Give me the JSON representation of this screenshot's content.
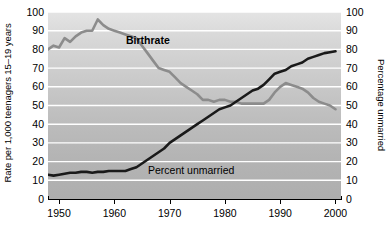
{
  "chart_data": {
    "type": "line",
    "title": "",
    "xlabel": "",
    "ylabel": "Rate per 1,000 teenagers 15–19 years",
    "ylabel_right": "Percentage unmarried",
    "xlim": [
      1948,
      2001
    ],
    "ylim": [
      0,
      100
    ],
    "grid": true,
    "gridlines_y": [
      10,
      20,
      30,
      40,
      50,
      60,
      70,
      80,
      90,
      100
    ],
    "legend_position": "inline-annotations",
    "xticks": [
      1950,
      1960,
      1970,
      1980,
      1990,
      2000
    ],
    "xtick_labels": [
      "1950",
      "1960",
      "1970",
      "1980",
      "1990",
      "2000"
    ],
    "yticks": [
      0,
      10,
      20,
      30,
      40,
      50,
      60,
      70,
      80,
      90,
      100
    ],
    "ytick_labels": [
      "0",
      "10",
      "20",
      "30",
      "40",
      "50",
      "60",
      "70",
      "80",
      "90",
      "100"
    ],
    "yticks_right": [
      0,
      10,
      20,
      30,
      40,
      50,
      60,
      70,
      80,
      90,
      100
    ],
    "ytick_labels_right": [
      "0",
      "10",
      "20",
      "30",
      "40",
      "50",
      "60",
      "70",
      "80",
      "90",
      "100"
    ],
    "series": [
      {
        "name": "Birthrate",
        "color": "#8c8c8c",
        "linewidth": 2.6,
        "annotation": "Birthrate",
        "x": [
          1948,
          1949,
          1950,
          1951,
          1952,
          1953,
          1954,
          1955,
          1956,
          1957,
          1958,
          1959,
          1960,
          1961,
          1962,
          1963,
          1964,
          1965,
          1966,
          1967,
          1968,
          1969,
          1970,
          1971,
          1972,
          1973,
          1974,
          1975,
          1976,
          1977,
          1978,
          1979,
          1980,
          1981,
          1982,
          1983,
          1984,
          1985,
          1986,
          1987,
          1988,
          1989,
          1990,
          1991,
          1992,
          1993,
          1994,
          1995,
          1996,
          1997,
          1998,
          1999,
          2000
        ],
        "values": [
          80,
          82,
          81,
          86,
          84,
          87,
          89,
          90,
          90,
          96,
          93,
          91,
          90,
          89,
          88,
          87,
          86,
          82,
          78,
          74,
          70,
          69,
          68,
          65,
          62,
          60,
          58,
          56,
          53,
          53,
          52,
          53,
          53,
          52,
          52,
          51,
          51,
          51,
          51,
          51,
          53,
          57,
          60,
          62,
          61,
          60,
          59,
          57,
          54,
          52,
          51,
          50,
          48
        ]
      },
      {
        "name": "Percent unmarried",
        "color": "#1a1a1a",
        "linewidth": 2.6,
        "annotation": "Percent unmarried",
        "x": [
          1948,
          1949,
          1950,
          1951,
          1952,
          1953,
          1954,
          1955,
          1956,
          1957,
          1958,
          1959,
          1960,
          1961,
          1962,
          1963,
          1964,
          1965,
          1966,
          1967,
          1968,
          1969,
          1970,
          1971,
          1972,
          1973,
          1974,
          1975,
          1976,
          1977,
          1978,
          1979,
          1980,
          1981,
          1982,
          1983,
          1984,
          1985,
          1986,
          1987,
          1988,
          1989,
          1990,
          1991,
          1992,
          1993,
          1994,
          1995,
          1996,
          1997,
          1998,
          1999,
          2000
        ],
        "values": [
          13,
          12.5,
          13,
          13.5,
          14,
          14,
          14.5,
          14.5,
          14,
          14.5,
          14.5,
          15,
          15,
          15,
          15,
          16,
          17,
          19,
          21,
          23,
          25,
          27,
          30,
          32,
          34,
          36,
          38,
          40,
          42,
          44,
          46,
          48,
          49,
          50,
          52,
          54,
          56,
          58,
          59,
          61,
          64,
          67,
          68,
          69,
          71,
          72,
          73,
          75,
          76,
          77,
          78,
          78.5,
          79
        ]
      }
    ]
  },
  "annotations": {
    "birthrate_label": "Birthrate",
    "unmarried_label": "Percent unmarried"
  }
}
